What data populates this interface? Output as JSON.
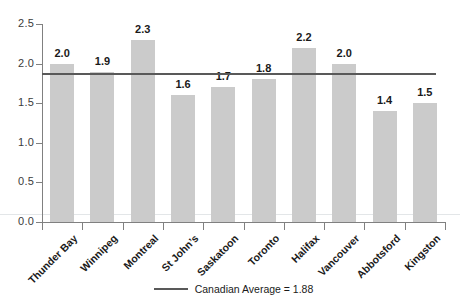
{
  "chart_data": {
    "type": "bar",
    "title": "",
    "xlabel": "",
    "ylabel": "",
    "categories": [
      "Thunder Bay",
      "Winnipeg",
      "Montreal",
      "St John’s",
      "Saskatoon",
      "Toronto",
      "Halifax",
      "Vancouver",
      "Abbotsford",
      "Kingston"
    ],
    "values": [
      2.0,
      1.9,
      2.3,
      1.6,
      1.7,
      1.8,
      2.2,
      2.0,
      1.4,
      1.5
    ],
    "value_labels": [
      "2.0",
      "1.9",
      "2.3",
      "1.6",
      "1.7",
      "1.8",
      "2.2",
      "2.0",
      "1.4",
      "1.5"
    ],
    "ylim": [
      0,
      2.5
    ],
    "yticks": [
      0.0,
      0.5,
      1.0,
      1.5,
      2.0,
      2.5
    ],
    "ytick_labels": [
      "0.0",
      "0.5",
      "1.0",
      "1.5",
      "2.0",
      "2.5"
    ],
    "grid": false,
    "legend_position": "bottom-center",
    "reference_line": {
      "label": "Canadian Average = 1.88",
      "value": 1.88,
      "color": "#595959"
    },
    "series": [
      {
        "name": "City value",
        "values": [
          2.0,
          1.9,
          2.3,
          1.6,
          1.7,
          1.8,
          2.2,
          2.0,
          1.4,
          1.5
        ],
        "color": "#cbcbcb"
      }
    ]
  },
  "colors": {
    "bar": "#cbcbcb",
    "axis": "#808080",
    "reference_line": "#595959",
    "text": "#1a1a1a",
    "faint_grid": "#e3e6e8"
  }
}
